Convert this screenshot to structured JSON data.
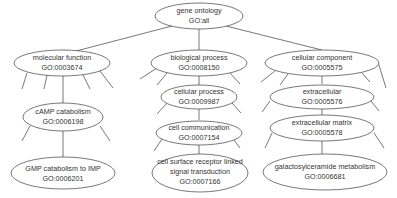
{
  "diagram": {
    "type": "tree",
    "colors": {
      "stroke": "#555555",
      "text": "#333333",
      "fill": "#ffffff"
    },
    "nodes": [
      {
        "id": "root",
        "name": "gene ontology",
        "go_id": "GO:all"
      },
      {
        "id": "mf",
        "name": "molecular function",
        "go_id": "GO:0003674"
      },
      {
        "id": "bp",
        "name": "biological process",
        "go_id": "GO:0008150"
      },
      {
        "id": "cc",
        "name": "cellular component",
        "go_id": "GO:0005575"
      },
      {
        "id": "camp",
        "name": "cAMP catabolism",
        "go_id": "GO:0006198"
      },
      {
        "id": "gmp",
        "name": "GMP catabolism to IMP",
        "go_id": "GO:0006201"
      },
      {
        "id": "cp",
        "name": "cellular process",
        "go_id": "GO:0009987"
      },
      {
        "id": "ccomm",
        "name": "cell communication",
        "go_id": "GO:0007154"
      },
      {
        "id": "csr",
        "name_line1": "cell surface receptor linked",
        "name_line2": "signal transduction",
        "go_id": "GO:0007166"
      },
      {
        "id": "ext",
        "name": "extracellular",
        "go_id": "GO:0005576"
      },
      {
        "id": "ecm",
        "name": "extracellular matrix",
        "go_id": "GO:0005578"
      },
      {
        "id": "gal",
        "name": "galactosylceramide metabolism",
        "go_id": "GO:0006681"
      }
    ],
    "edges": [
      [
        "root",
        "mf"
      ],
      [
        "root",
        "bp"
      ],
      [
        "root",
        "cc"
      ],
      [
        "mf",
        "camp"
      ],
      [
        "camp",
        "gmp"
      ],
      [
        "bp",
        "cp"
      ],
      [
        "cp",
        "ccomm"
      ],
      [
        "ccomm",
        "csr"
      ],
      [
        "cc",
        "ext"
      ],
      [
        "ext",
        "ecm"
      ],
      [
        "ecm",
        "gal"
      ]
    ]
  }
}
